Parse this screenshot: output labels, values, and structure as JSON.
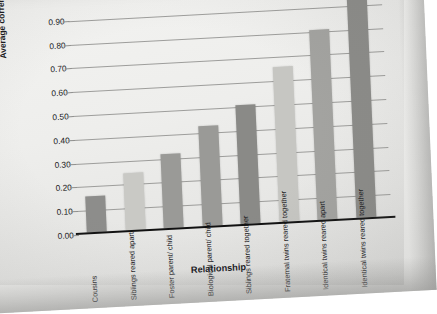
{
  "figure": {
    "top_cropped_text": "Average",
    "x_axis_title": "Relationship",
    "y_axis_title": "Average correlations between IQ scores"
  },
  "chart_data": {
    "type": "bar",
    "title": "",
    "xlabel": "Relationship",
    "ylabel": "Average correlations between IQ scores",
    "ylim": [
      0.0,
      0.95
    ],
    "ytick_labels": [
      "0.00",
      "0.10",
      "0.20",
      "0.30",
      "0.40",
      "0.50",
      "0.60",
      "0.70",
      "0.80",
      "0.90"
    ],
    "ytick_values": [
      0.0,
      0.1,
      0.2,
      0.3,
      0.4,
      0.5,
      0.6,
      0.7,
      0.8,
      0.9
    ],
    "grid": true,
    "legend": "none",
    "categories": [
      "Cousins",
      "Siblings reared apart",
      "Foster parent/ child",
      "Biological parent/ child",
      "Siblings reared together",
      "Fraternal twins reared together",
      "Identical twins reared apart",
      "Identical twins reared together"
    ],
    "values": [
      0.15,
      0.24,
      0.31,
      0.42,
      0.5,
      0.65,
      0.8,
      0.93
    ],
    "bar_colors": [
      "#8d8d8b",
      "#c9c9c5",
      "#9a9a97",
      "#9a9a97",
      "#8a8a87",
      "#c6c6c2",
      "#a3a3a0",
      "#8b8b88"
    ]
  },
  "colors": {
    "paper": "#efefed",
    "axis": "#111111",
    "gridline": "#9d9d9b",
    "text": "#1a1a1d"
  }
}
